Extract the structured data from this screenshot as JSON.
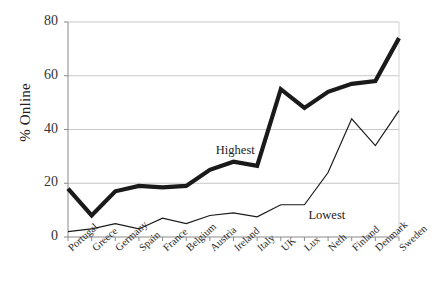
{
  "chart_data": {
    "type": "line",
    "title": "",
    "xlabel": "",
    "ylabel": "% Online",
    "ylim": [
      0,
      80
    ],
    "yticks": [
      0,
      20,
      40,
      60,
      80
    ],
    "grid": "horizontal",
    "legend_position": "inline-annotation",
    "categories": [
      "Portugal",
      "Greece",
      "Germany",
      "Spain",
      "France",
      "Belgium",
      "Austria",
      "Ireland",
      "Italy",
      "UK",
      "Lux",
      "Neth",
      "Finland",
      "Denmark",
      "Sweden"
    ],
    "series": [
      {
        "name": "Highest",
        "style": "thick",
        "color": "#1a1a1a",
        "values": [
          18,
          8,
          17,
          19,
          18.5,
          19,
          25,
          28,
          26.5,
          55,
          48,
          54,
          57,
          58,
          74
        ]
      },
      {
        "name": "Lowest",
        "style": "thin",
        "color": "#1a1a1a",
        "values": [
          2,
          3,
          5,
          3,
          7,
          5,
          8,
          9,
          7.5,
          12,
          12,
          24,
          44,
          34,
          47
        ]
      }
    ],
    "annotations": [
      {
        "text": "Highest",
        "series": "Highest"
      },
      {
        "text": "Lowest",
        "series": "Lowest"
      }
    ]
  }
}
